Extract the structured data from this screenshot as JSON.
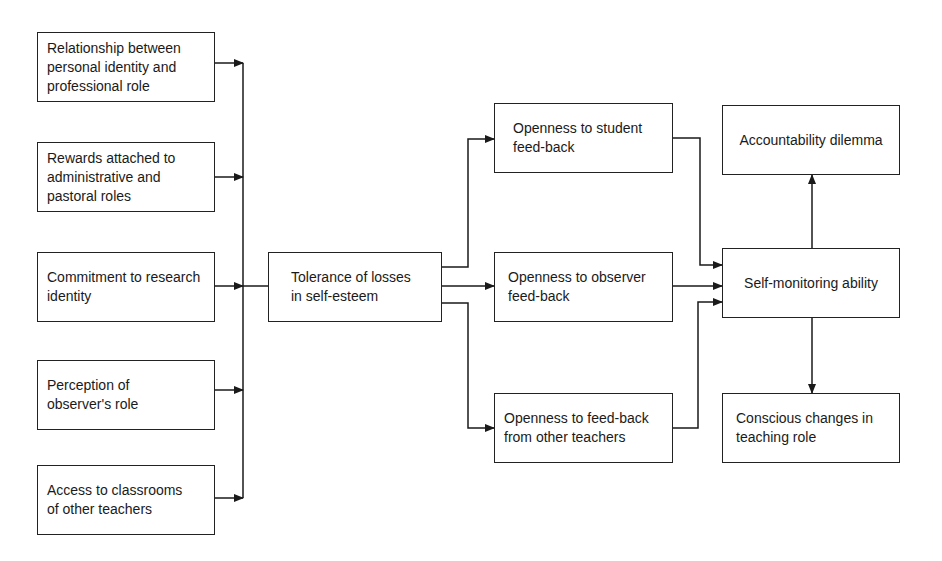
{
  "diagram": {
    "type": "flowchart",
    "inputs": [
      {
        "id": "relationship",
        "label": "Relationship between\npersonal identity and\nprofessional role"
      },
      {
        "id": "rewards",
        "label": "Rewards attached to\nadministrative and\npastoral roles"
      },
      {
        "id": "commitment",
        "label": "Commitment to research\nidentity"
      },
      {
        "id": "perception",
        "label": "Perception of\nobserver's role"
      },
      {
        "id": "access",
        "label": "Access to classrooms\nof other teachers"
      }
    ],
    "central": {
      "id": "tolerance",
      "label": "Tolerance of losses\nin self-esteem"
    },
    "openness": [
      {
        "id": "student",
        "label": "Openness to student\nfeed-back"
      },
      {
        "id": "observer",
        "label": "Openness to observer\nfeed-back"
      },
      {
        "id": "teachers",
        "label": "Openness to feed-back\nfrom other teachers"
      }
    ],
    "outcome": {
      "id": "self_monitoring",
      "label": "Self-monitoring ability"
    },
    "results": [
      {
        "id": "accountability",
        "label": "Accountability dilemma"
      },
      {
        "id": "conscious",
        "label": "Conscious changes in\nteaching role"
      }
    ],
    "edges": [
      [
        "relationship",
        "bus"
      ],
      [
        "rewards",
        "bus"
      ],
      [
        "commitment",
        "bus"
      ],
      [
        "perception",
        "bus"
      ],
      [
        "access",
        "bus"
      ],
      [
        "bus",
        "tolerance"
      ],
      [
        "tolerance",
        "student"
      ],
      [
        "tolerance",
        "observer"
      ],
      [
        "tolerance",
        "teachers"
      ],
      [
        "student",
        "self_monitoring"
      ],
      [
        "observer",
        "self_monitoring"
      ],
      [
        "teachers",
        "self_monitoring"
      ],
      [
        "self_monitoring",
        "accountability"
      ],
      [
        "self_monitoring",
        "conscious"
      ]
    ]
  }
}
